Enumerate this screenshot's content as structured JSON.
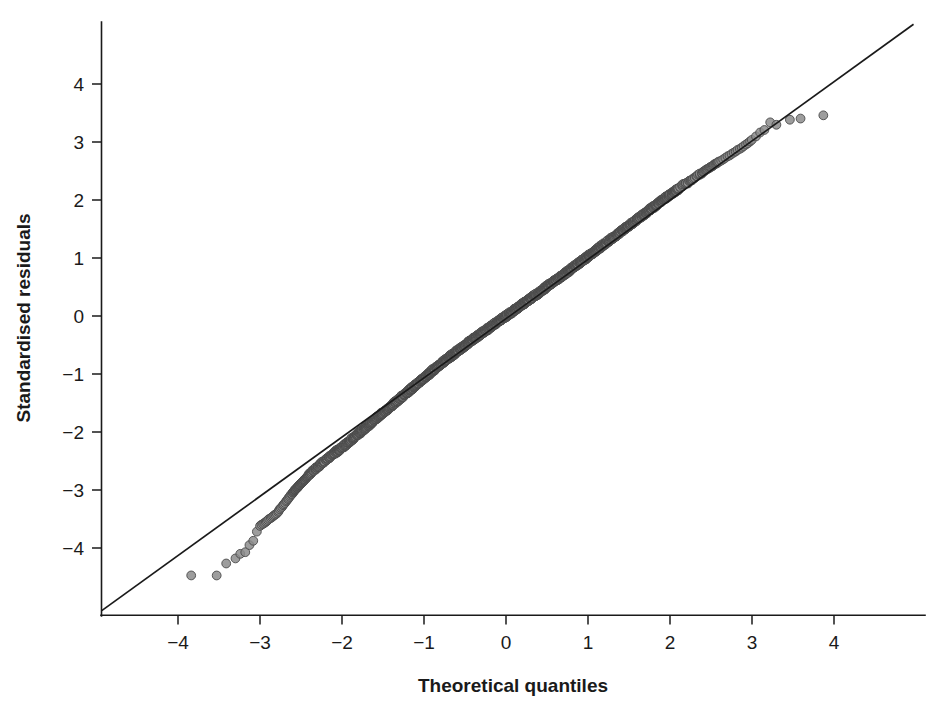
{
  "figure": {
    "background": "#ffffff",
    "width": 933,
    "height": 716
  },
  "chart_data": {
    "type": "scatter",
    "title": "",
    "subtitle": "",
    "xlabel": "Theoretical quantiles",
    "ylabel": "Standardised residuals",
    "xlim": [
      -4.95,
      5.05
    ],
    "ylim": [
      -5.1,
      5.05
    ],
    "xticks": [
      -4,
      -3,
      -2,
      -1,
      0,
      1,
      2,
      3,
      4
    ],
    "xtick_labels": [
      "-4",
      "-3",
      "-2",
      "-1",
      "0",
      "1",
      "2",
      "3",
      "4"
    ],
    "yticks": [
      -4,
      -3,
      -2,
      -1,
      0,
      1,
      2,
      3,
      4
    ],
    "ytick_labels": [
      "-4",
      "-3",
      "-2",
      "-1",
      "0",
      "1",
      "2",
      "3",
      "4"
    ],
    "grid": false,
    "legend": null,
    "legend_position": "none",
    "annotations": [],
    "reference_line": {
      "name": "y = x identity line",
      "kind": "line",
      "x": [
        -4.93,
        4.97
      ],
      "y": [
        -5.08,
        5.03
      ],
      "color": "#1a1a1a",
      "width": 1.7
    },
    "marker": {
      "shape": "circle",
      "radius_px": 4.4,
      "fill": "#8c8c8c",
      "edge": "#4a4a4a",
      "fill_opacity": 0.85
    },
    "series": [
      {
        "name": "Standardised residuals vs theoretical quantiles",
        "n_points": 1400,
        "description": "Normal Q-Q plot; central mass follows the identity line, lower tail falls below the line (light left tail), a few upper-tail points lie above the line.",
        "points": [
          [
            -3.84,
            -4.47
          ],
          [
            -3.53,
            -4.47
          ],
          [
            -3.41,
            -4.27
          ],
          [
            -3.3,
            -4.18
          ],
          [
            -3.24,
            -4.1
          ],
          [
            -3.18,
            -4.07
          ],
          [
            -3.13,
            -3.95
          ],
          [
            -3.08,
            -3.88
          ],
          [
            -3.04,
            -3.72
          ],
          [
            -3.0,
            -3.62
          ],
          [
            -2.96,
            -3.58
          ],
          [
            -2.93,
            -3.55
          ],
          [
            -2.9,
            -3.52
          ],
          [
            -2.87,
            -3.48
          ],
          [
            -2.84,
            -3.45
          ],
          [
            -2.81,
            -3.42
          ],
          [
            -2.78,
            -3.38
          ],
          [
            -2.76,
            -3.33
          ],
          [
            -2.73,
            -3.29
          ],
          [
            -2.71,
            -3.24
          ],
          [
            -2.68,
            -3.2
          ],
          [
            -2.66,
            -3.16
          ],
          [
            -2.64,
            -3.12
          ],
          [
            -2.62,
            -3.08
          ],
          [
            -2.6,
            -3.05
          ],
          [
            -2.58,
            -3.01
          ],
          [
            -2.56,
            -2.98
          ],
          [
            -2.54,
            -2.95
          ],
          [
            -2.52,
            -2.92
          ],
          [
            -2.5,
            -2.89
          ],
          [
            -2.48,
            -2.86
          ],
          [
            -2.46,
            -2.83
          ],
          [
            -2.44,
            -2.8
          ],
          [
            -2.42,
            -2.77
          ],
          [
            -2.4,
            -2.74
          ],
          [
            -2.38,
            -2.71
          ],
          [
            -2.36,
            -2.68
          ],
          [
            -2.34,
            -2.66
          ],
          [
            -2.32,
            -2.63
          ],
          [
            -2.3,
            -2.61
          ],
          [
            -2.28,
            -2.58
          ],
          [
            -2.26,
            -2.56
          ],
          [
            -2.24,
            -2.53
          ],
          [
            -2.22,
            -2.51
          ],
          [
            -2.2,
            -2.48
          ],
          [
            -2.18,
            -2.46
          ],
          [
            -2.16,
            -2.44
          ],
          [
            -2.14,
            -2.41
          ],
          [
            -2.12,
            -2.39
          ],
          [
            -2.1,
            -2.37
          ],
          [
            -2.05,
            -2.32
          ],
          [
            -2.0,
            -2.27
          ],
          [
            -1.95,
            -2.21
          ],
          [
            -1.9,
            -2.15
          ],
          [
            -1.85,
            -2.09
          ],
          [
            -1.8,
            -2.03
          ],
          [
            -1.75,
            -1.97
          ],
          [
            -1.7,
            -1.91
          ],
          [
            -1.65,
            -1.85
          ],
          [
            -1.6,
            -1.79
          ],
          [
            -1.55,
            -1.73
          ],
          [
            -1.5,
            -1.67
          ],
          [
            -1.45,
            -1.61
          ],
          [
            -1.4,
            -1.55
          ],
          [
            -1.35,
            -1.49
          ],
          [
            -1.3,
            -1.43
          ],
          [
            -1.25,
            -1.37
          ],
          [
            -1.2,
            -1.31
          ],
          [
            -1.15,
            -1.25
          ],
          [
            -1.1,
            -1.19
          ],
          [
            -1.05,
            -1.13
          ],
          [
            -1.0,
            -1.07
          ],
          [
            -0.95,
            -1.01
          ],
          [
            -0.9,
            -0.95
          ],
          [
            -0.85,
            -0.89
          ],
          [
            -0.8,
            -0.83
          ],
          [
            -0.75,
            -0.78
          ],
          [
            -0.7,
            -0.72
          ],
          [
            -0.65,
            -0.67
          ],
          [
            -0.6,
            -0.61
          ],
          [
            -0.55,
            -0.56
          ],
          [
            -0.5,
            -0.51
          ],
          [
            -0.45,
            -0.45
          ],
          [
            -0.4,
            -0.4
          ],
          [
            -0.35,
            -0.35
          ],
          [
            -0.3,
            -0.3
          ],
          [
            -0.25,
            -0.25
          ],
          [
            -0.2,
            -0.2
          ],
          [
            -0.15,
            -0.15
          ],
          [
            -0.1,
            -0.1
          ],
          [
            -0.05,
            -0.05
          ],
          [
            0.0,
            0.0
          ],
          [
            0.05,
            0.05
          ],
          [
            0.1,
            0.1
          ],
          [
            0.15,
            0.15
          ],
          [
            0.2,
            0.2
          ],
          [
            0.25,
            0.25
          ],
          [
            0.3,
            0.3
          ],
          [
            0.35,
            0.35
          ],
          [
            0.4,
            0.4
          ],
          [
            0.45,
            0.45
          ],
          [
            0.5,
            0.51
          ],
          [
            0.55,
            0.56
          ],
          [
            0.6,
            0.61
          ],
          [
            0.65,
            0.66
          ],
          [
            0.7,
            0.71
          ],
          [
            0.75,
            0.76
          ],
          [
            0.8,
            0.82
          ],
          [
            0.85,
            0.87
          ],
          [
            0.9,
            0.92
          ],
          [
            0.95,
            0.97
          ],
          [
            1.0,
            1.03
          ],
          [
            1.05,
            1.08
          ],
          [
            1.1,
            1.13
          ],
          [
            1.15,
            1.19
          ],
          [
            1.2,
            1.24
          ],
          [
            1.25,
            1.29
          ],
          [
            1.3,
            1.35
          ],
          [
            1.35,
            1.4
          ],
          [
            1.4,
            1.45
          ],
          [
            1.45,
            1.51
          ],
          [
            1.5,
            1.56
          ],
          [
            1.55,
            1.61
          ],
          [
            1.6,
            1.67
          ],
          [
            1.65,
            1.72
          ],
          [
            1.7,
            1.77
          ],
          [
            1.75,
            1.83
          ],
          [
            1.8,
            1.88
          ],
          [
            1.85,
            1.93
          ],
          [
            1.9,
            1.99
          ],
          [
            1.95,
            2.04
          ],
          [
            2.0,
            2.09
          ],
          [
            2.05,
            2.14
          ],
          [
            2.1,
            2.19
          ],
          [
            2.15,
            2.24
          ],
          [
            2.2,
            2.29
          ],
          [
            2.25,
            2.34
          ],
          [
            2.3,
            2.38
          ],
          [
            2.35,
            2.43
          ],
          [
            2.4,
            2.48
          ],
          [
            2.45,
            2.53
          ],
          [
            2.5,
            2.57
          ],
          [
            2.55,
            2.62
          ],
          [
            2.6,
            2.66
          ],
          [
            2.65,
            2.7
          ],
          [
            2.7,
            2.75
          ],
          [
            2.75,
            2.79
          ],
          [
            2.8,
            2.84
          ],
          [
            2.85,
            2.88
          ],
          [
            2.9,
            2.93
          ],
          [
            2.95,
            2.98
          ],
          [
            3.0,
            3.04
          ],
          [
            3.05,
            3.1
          ],
          [
            3.1,
            3.16
          ],
          [
            3.15,
            3.21
          ],
          [
            3.22,
            3.34
          ],
          [
            3.3,
            3.3
          ],
          [
            3.46,
            3.38
          ],
          [
            3.59,
            3.4
          ],
          [
            3.87,
            3.46
          ]
        ]
      }
    ]
  },
  "axes": {
    "x_axis": {
      "label": "Theoretical quantiles",
      "ticks": [
        "-4",
        "-3",
        "-2",
        "-1",
        "0",
        "1",
        "2",
        "3",
        "4"
      ]
    },
    "y_axis": {
      "label": "Standardised residuals",
      "ticks": [
        "4",
        "3",
        "2",
        "1",
        "0",
        "-1",
        "-2",
        "-3",
        "-4"
      ]
    }
  }
}
